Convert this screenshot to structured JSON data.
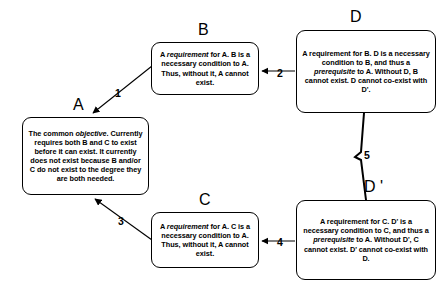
{
  "diagram": {
    "stroke_color": "#000000",
    "background_color": "#ffffff",
    "nodes": [
      {
        "id": "A",
        "label": "A",
        "name": "node-a-objective",
        "text_runs": [
          {
            "t": "The common ",
            "i": false
          },
          {
            "t": "objective",
            "i": true
          },
          {
            "t": ". Currently requires both B and C to exist before it can exist.  It currently does not exist because B and/or C do not exist to the degree they are both needed.",
            "i": false
          }
        ],
        "plain_text": "The common objective. Currently requires both B and C to exist before it can exist. It currently does not exist because B and/or C do not exist to the degree they are both needed."
      },
      {
        "id": "B",
        "label": "B",
        "name": "node-b-requirement",
        "text_runs": [
          {
            "t": "A ",
            "i": false
          },
          {
            "t": "requirement",
            "i": true
          },
          {
            "t": " for A.  B is a necessary condition to A.  Thus, without it, A cannot exist.",
            "i": false
          }
        ],
        "plain_text": "A requirement for A. B is a necessary condition to A. Thus, without it, A cannot exist."
      },
      {
        "id": "C",
        "label": "C",
        "name": "node-c-requirement",
        "text_runs": [
          {
            "t": "A ",
            "i": false
          },
          {
            "t": "requirement",
            "i": true
          },
          {
            "t": " for A.  C is a necessary condition to A.  Thus, without it, A cannot exist.",
            "i": false
          }
        ],
        "plain_text": "A requirement for A. C is a necessary condition to A. Thus, without it, A cannot exist."
      },
      {
        "id": "D",
        "label": "D",
        "name": "node-d-prerequisite",
        "text_runs": [
          {
            "t": "A requirement for B.  D is a necessary condition to B, and thus a ",
            "i": false
          },
          {
            "t": "prerequisite",
            "i": true
          },
          {
            "t": "  to A. Without D, B cannot exist. D cannot co-exist with D'.",
            "i": false
          }
        ],
        "plain_text": "A requirement for B. D is a necessary condition to B, and thus a prerequisite to A. Without D, B cannot exist. D cannot co-exist with D'."
      },
      {
        "id": "Dprime",
        "label": "D '",
        "name": "node-dprime-prerequisite",
        "text_runs": [
          {
            "t": "A requirement for C.  D' is a necessary condition to C, and thus a ",
            "i": false
          },
          {
            "t": "prerequisite",
            "i": true
          },
          {
            "t": " to A.  Without D', C cannot exist.",
            "i": false
          },
          {
            "t": "\nD' cannot co-exist with D.",
            "i": false
          }
        ],
        "plain_text": "A requirement for C. D' is a necessary condition to C, and thus a prerequisite to A. Without D', C cannot exist. D' cannot co-exist with D."
      }
    ],
    "edges": [
      {
        "id": "1",
        "label": "1",
        "name": "edge-b-to-a",
        "from": "B",
        "to": "A",
        "kind": "arrow"
      },
      {
        "id": "2",
        "label": "2",
        "name": "edge-d-to-b",
        "from": "D",
        "to": "B",
        "kind": "arrow"
      },
      {
        "id": "3",
        "label": "3",
        "name": "edge-c-to-a",
        "from": "C",
        "to": "A",
        "kind": "arrow"
      },
      {
        "id": "4",
        "label": "4",
        "name": "edge-dprime-to-c",
        "from": "Dprime",
        "to": "C",
        "kind": "arrow"
      },
      {
        "id": "5",
        "label": "5",
        "name": "edge-d-conflict-dprime",
        "from": "D",
        "to": "Dprime",
        "kind": "conflict-zigzag"
      }
    ]
  }
}
